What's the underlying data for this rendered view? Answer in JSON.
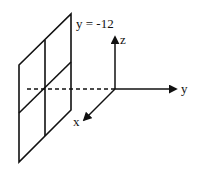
{
  "diagram": {
    "plane_label": "y = -12",
    "axes": [
      {
        "name": "x",
        "label": "x"
      },
      {
        "name": "y",
        "label": "y"
      },
      {
        "name": "z",
        "label": "z"
      }
    ],
    "stroke_color": "#111111",
    "background_color": "#ffffff"
  }
}
